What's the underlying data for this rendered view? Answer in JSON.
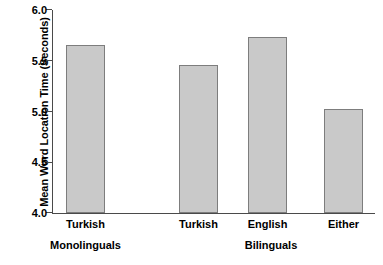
{
  "chart_data": {
    "type": "bar",
    "title": "",
    "subtitle": "",
    "xlabel": "",
    "ylabel": "Mean Word Location Time (Seconds)",
    "categories": [
      "Turkish",
      "Turkish",
      "English",
      "Either"
    ],
    "values": [
      5.66,
      5.46,
      5.73,
      5.02
    ],
    "series": [
      {
        "name": "Mean Word Location Time",
        "values": [
          5.66,
          5.46,
          5.73,
          5.02
        ]
      }
    ],
    "groups": [
      {
        "label": "Monolinguals",
        "categories": [
          "Turkish"
        ]
      },
      {
        "label": "Bilinguals",
        "categories": [
          "Turkish",
          "English",
          "Either"
        ]
      }
    ],
    "ylim": [
      4.0,
      6.0
    ],
    "yticks": [
      "4.0",
      "4.5",
      "5.0",
      "5.5",
      "6.0"
    ],
    "ytick_values": [
      4.0,
      4.5,
      5.0,
      5.5,
      6.0
    ],
    "grid": false,
    "legend": false,
    "legend_position": "none",
    "bar_color": "#c9c9c9",
    "bar_edge_color": "#7d7d7d",
    "axis_color": "#4a4a4a",
    "background_color": "#ffffff"
  },
  "axis": {
    "y_title": "Mean Word Location Time (Seconds)",
    "ticks": [
      {
        "label": "6.0",
        "value": 6.0
      },
      {
        "label": "5.5",
        "value": 5.5
      },
      {
        "label": "5.0",
        "value": 5.0
      },
      {
        "label": "4.5",
        "value": 4.5
      },
      {
        "label": "4.0",
        "value": 4.0
      }
    ]
  },
  "bars": [
    {
      "label": "Turkish",
      "value": 5.66,
      "group": "Monolinguals"
    },
    {
      "label": "Turkish",
      "value": 5.46,
      "group": "Bilinguals"
    },
    {
      "label": "English",
      "value": 5.73,
      "group": "Bilinguals"
    },
    {
      "label": "Either",
      "value": 5.02,
      "group": "Bilinguals"
    }
  ],
  "groups": [
    {
      "label": "Monolinguals"
    },
    {
      "label": "Bilinguals"
    }
  ]
}
